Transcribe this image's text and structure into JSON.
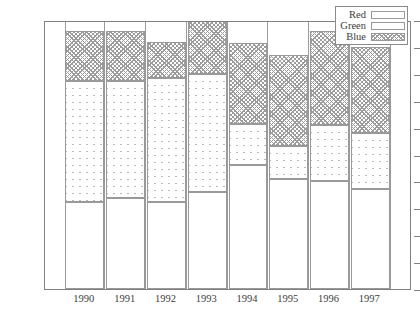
{
  "chart_data": {
    "type": "bar",
    "subtype": "stacked",
    "title": "",
    "xlabel": "",
    "ylabel": "",
    "categories": [
      "1990",
      "1991",
      "1992",
      "1993",
      "1994",
      "1995",
      "1996",
      "1997"
    ],
    "series": [
      {
        "name": "Red",
        "values": [
          32.5,
          34,
          32.5,
          36,
          46,
          41,
          40,
          37
        ]
      },
      {
        "name": "Green",
        "values": [
          45,
          43.5,
          46,
          44,
          15.5,
          12,
          21,
          21
        ]
      },
      {
        "name": "Blue",
        "values": [
          18.5,
          18.5,
          13.5,
          24.5,
          30,
          34,
          35,
          32
        ]
      }
    ],
    "cumulative_tops": [
      {
        "category": "1990",
        "red": 32.5,
        "green": 77.5,
        "blue": 96
      },
      {
        "category": "1991",
        "red": 34,
        "green": 77.5,
        "blue": 96
      },
      {
        "category": "1992",
        "red": 32.5,
        "green": 78.5,
        "blue": 92
      },
      {
        "category": "1993",
        "red": 36,
        "green": 80,
        "blue": 104.5
      },
      {
        "category": "1994",
        "red": 46,
        "green": 61.5,
        "blue": 91.5
      },
      {
        "category": "1995",
        "red": 41,
        "green": 53,
        "blue": 87
      },
      {
        "category": "1996",
        "red": 40,
        "green": 61,
        "blue": 96
      },
      {
        "category": "1997",
        "red": 37,
        "green": 58,
        "blue": 90
      }
    ],
    "ylim": [
      10,
      110
    ],
    "ytick_step": 10,
    "yticks": [
      10,
      20,
      30,
      40,
      50,
      60,
      70,
      80,
      90,
      100,
      110
    ],
    "grid": false,
    "legend": {
      "position": "top-right",
      "entries": [
        {
          "label": "Red",
          "pattern": "solid-white"
        },
        {
          "label": "Green",
          "pattern": "diagonal-cross-coarse"
        },
        {
          "label": "Blue",
          "pattern": "diagonal-cross-fine"
        }
      ]
    }
  },
  "colors": {
    "axis": "#808080",
    "outline": "#999999",
    "text": "#3c3c3c",
    "background": "#ffffff"
  }
}
